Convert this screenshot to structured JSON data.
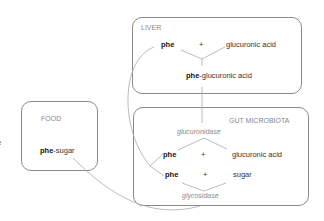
{
  "cut_text": "e",
  "liver": {
    "label": "LIVER",
    "reactant1": "phe",
    "plus": "+",
    "reactant2": "glucuronic acid",
    "product_bold": "phe",
    "product_rest": "-glucuronic acid"
  },
  "food": {
    "label": "FOOD",
    "item_bold": "phe",
    "item_rest": "-sugar"
  },
  "gut": {
    "label": "GUT MICROBIOTA",
    "enzyme1": "glucuronidase",
    "row1": {
      "a": "phe",
      "plus": "+",
      "b": "glucuronic acid"
    },
    "row2": {
      "a": "phe",
      "plus": "+",
      "b": "sugar"
    },
    "enzyme2": "glycosidase"
  },
  "colors": {
    "line": "#aaaaaa",
    "box": "#8a8a8a",
    "label": "#888888"
  }
}
